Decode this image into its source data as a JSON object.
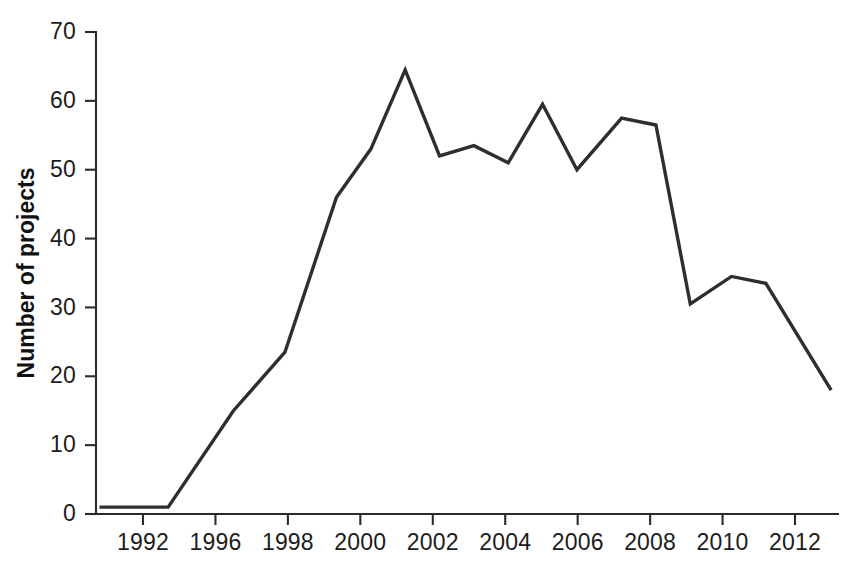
{
  "chart_data": {
    "type": "line",
    "title": "",
    "subtitle": "",
    "xlabel": "",
    "ylabel": "Number of projects",
    "xlim": [
      1991.0,
      2012.6
    ],
    "ylim": [
      0,
      70
    ],
    "grid": false,
    "legend": null,
    "legend_position": "none",
    "line_color": "#2e2e2e",
    "x_tick_labels": [
      "1992",
      "1996",
      "1998",
      "2000",
      "2002",
      "2004",
      "2006",
      "2008",
      "2010",
      "2012"
    ],
    "x_tick_values": [
      1992,
      1996,
      1998,
      2000,
      2002,
      2004,
      2006,
      2008,
      2010,
      2012
    ],
    "y_tick_labels": [
      "0",
      "10",
      "20",
      "30",
      "40",
      "50",
      "60",
      "70"
    ],
    "y_tick_values": [
      0,
      10,
      20,
      30,
      40,
      50,
      60,
      70
    ],
    "series": [
      {
        "name": "Number of projects",
        "x": [
          1991.1,
          1993.1,
          1995.0,
          1996.5,
          1998.0,
          1999.0,
          2000.0,
          2001.0,
          2002.0,
          2003.0,
          2004.0,
          2005.0,
          2006.3,
          2007.3,
          2008.3,
          2009.5,
          2010.5,
          2012.4
        ],
        "values": [
          1,
          1,
          15,
          23.5,
          46,
          53,
          64.5,
          52,
          53.5,
          51,
          59.5,
          50,
          57.5,
          56.5,
          30.5,
          34.5,
          33.5,
          18
        ]
      }
    ]
  },
  "axes": {
    "y_axis_title": "Number of projects"
  }
}
